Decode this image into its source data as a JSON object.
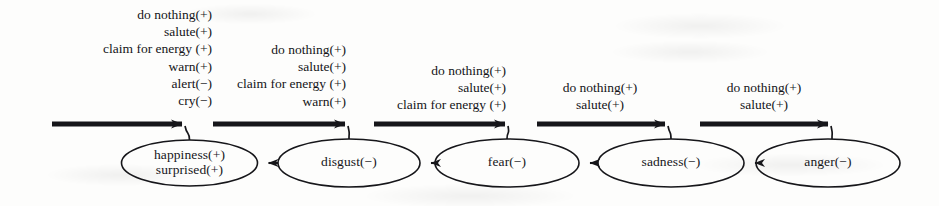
{
  "figure": {
    "type": "state-transition-diagram",
    "width": 939,
    "height": 206,
    "ink_color": "#16161a",
    "background_color": "#fdfdfc"
  },
  "states": [
    {
      "id": "happiness",
      "lines": [
        "happiness(+)",
        "surprised(+)"
      ],
      "cx": 189.5,
      "cy": 163,
      "rx": 68,
      "ry": 23
    },
    {
      "id": "disgust",
      "lines": [
        "disgust(−)"
      ],
      "cx": 349,
      "cy": 163,
      "rx": 71,
      "ry": 24
    },
    {
      "id": "fear",
      "lines": [
        "fear(−)"
      ],
      "cx": 507,
      "cy": 163,
      "rx": 72,
      "ry": 24
    },
    {
      "id": "sadness",
      "lines": [
        "sadness(−)"
      ],
      "cx": 671,
      "cy": 163,
      "rx": 73,
      "ry": 24
    },
    {
      "id": "anger",
      "lines": [
        "anger(−)"
      ],
      "cx": 828,
      "cy": 163,
      "rx": 72,
      "ry": 24
    }
  ],
  "transitions": [
    {
      "id": "disgust-to-happiness",
      "from": "disgust",
      "to": "happiness"
    },
    {
      "id": "fear-to-disgust",
      "from": "fear",
      "to": "disgust"
    },
    {
      "id": "sadness-to-fear",
      "from": "sadness",
      "to": "fear"
    },
    {
      "id": "anger-to-sadness",
      "from": "anger",
      "to": "sadness"
    }
  ],
  "action_blocks": [
    {
      "id": "actions-happiness",
      "for_state": "happiness",
      "align": "right",
      "lines": [
        "do  nothing(+)",
        "salute(+)",
        "claim  for  energy  (+)",
        "warn(+)",
        "alert(−)",
        "cry(−)"
      ],
      "text_left": 40,
      "text_top": 6,
      "text_width": 172,
      "bar": {
        "x1": 52,
        "x2": 182,
        "y": 124
      },
      "hook": {
        "from_x": 182,
        "to_x": 189.5
      }
    },
    {
      "id": "actions-disgust",
      "for_state": "disgust",
      "align": "right",
      "lines": [
        "do  nothing(+)",
        "salute(+)",
        "claim  for  energy  (+)",
        "warn(+)"
      ],
      "text_left": 200,
      "text_top": 41,
      "text_width": 146,
      "bar": {
        "x1": 213,
        "x2": 345,
        "y": 124
      },
      "hook": {
        "from_x": 345,
        "to_x": 349
      }
    },
    {
      "id": "actions-fear",
      "for_state": "fear",
      "align": "right",
      "lines": [
        "do  nothing(+)",
        "salute(+)",
        "claim  for  energy  (+)"
      ],
      "text_left": 360,
      "text_top": 62,
      "text_width": 146,
      "bar": {
        "x1": 374,
        "x2": 505,
        "y": 124
      },
      "hook": {
        "from_x": 505,
        "to_x": 507
      }
    },
    {
      "id": "actions-sadness",
      "for_state": "sadness",
      "align": "center",
      "lines": [
        "do  nothing(+)",
        "salute(+)"
      ],
      "text_left": 530,
      "text_top": 79,
      "text_width": 140,
      "bar": {
        "x1": 537,
        "x2": 665,
        "y": 124
      },
      "hook": {
        "from_x": 665,
        "to_x": 671
      }
    },
    {
      "id": "actions-anger",
      "for_state": "anger",
      "align": "center",
      "lines": [
        "do  nothing(+)",
        "salute(+)"
      ],
      "text_left": 694,
      "text_top": 79,
      "text_width": 140,
      "bar": {
        "x1": 700,
        "x2": 828,
        "y": 124
      },
      "hook": {
        "from_x": 828,
        "to_x": 832
      }
    }
  ]
}
